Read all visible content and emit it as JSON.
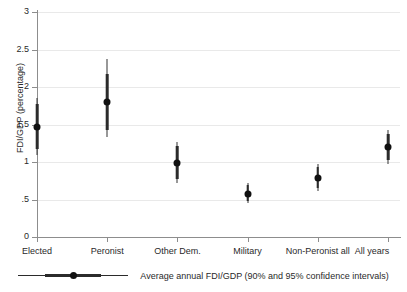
{
  "chart_data": {
    "type": "scatter",
    "title": "",
    "subtitle": "",
    "xlabel": "",
    "ylabel": "FDI/GDP (percentage)",
    "ylim": [
      0,
      3
    ],
    "ytick_values": [
      0,
      0.5,
      1,
      1.5,
      2,
      2.5,
      3
    ],
    "ytick_labels": [
      "0",
      ".5",
      "1",
      "1.5",
      "2",
      "2.5",
      "3"
    ],
    "grid": true,
    "grid_axis": "y",
    "legend_position": "bottom",
    "legend_entries": [
      "Average annual FDI/GDP (90% and 95% confidence intervals)"
    ],
    "categories": [
      "Elected",
      "Peronist",
      "Other Dem.",
      "Military",
      "Non-Peronist all",
      "All years"
    ],
    "series": [
      {
        "name": "Average annual FDI/GDP",
        "values": [
          1.47,
          1.8,
          0.99,
          0.58,
          0.79,
          1.2
        ],
        "ci90_low": [
          1.17,
          1.43,
          0.78,
          0.48,
          0.66,
          1.03
        ],
        "ci90_high": [
          1.77,
          2.17,
          1.21,
          0.69,
          0.93,
          1.38
        ],
        "ci95_low": [
          1.09,
          1.33,
          0.72,
          0.45,
          0.62,
          0.98
        ],
        "ci95_high": [
          1.85,
          2.37,
          1.27,
          0.72,
          0.97,
          1.43
        ]
      }
    ]
  },
  "legend": {
    "label": "Average annual FDI/GDP (90% and 95% confidence intervals)"
  },
  "colors": {
    "marker": "#111111",
    "ci": "#2b2b2b",
    "axis": "#8d8d8d",
    "grid": "#e9e9e9",
    "text": "#2a2a2a",
    "background": "#ffffff"
  }
}
